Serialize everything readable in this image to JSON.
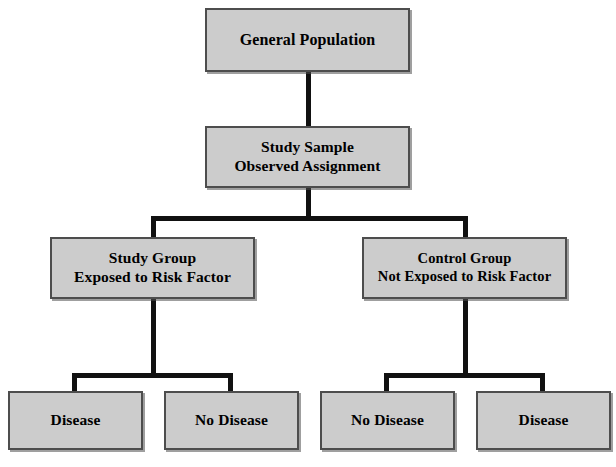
{
  "diagram": {
    "box_fill": "#cccccc",
    "box_border": "#4d4d4d",
    "connector_color": "#111111",
    "background": "#ffffff",
    "nodes": {
      "general_population": {
        "line1": "General Population"
      },
      "study_sample": {
        "line1": "Study Sample",
        "line2": "Observed Assignment"
      },
      "study_group": {
        "line1": "Study Group",
        "line2": "Exposed to Risk Factor"
      },
      "control_group": {
        "line1": "Control Group",
        "line2": "Not Exposed to Risk Factor"
      },
      "outcome_1": {
        "line1": "Disease"
      },
      "outcome_2": {
        "line1": "No Disease"
      },
      "outcome_3": {
        "line1": "No Disease"
      },
      "outcome_4": {
        "line1": "Disease"
      }
    }
  }
}
